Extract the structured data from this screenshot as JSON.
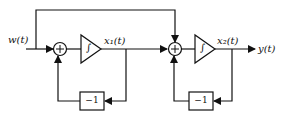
{
  "diagram": {
    "type": "block-diagram",
    "input_label": "w(t)",
    "output_label": "y(t)",
    "state1_label": "x₁(t)",
    "state2_label": "x₂(t)",
    "integrator_symbol": "∫",
    "summer_symbol": "+",
    "gain1_label": "−1",
    "gain2_label": "−1"
  }
}
